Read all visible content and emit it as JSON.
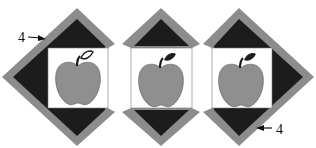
{
  "diagram": {
    "colors": {
      "background": "#ffffff",
      "border_strip": "#8c8c8c",
      "dark_triangle": "#1c1c1c",
      "center_square": "#ffffff",
      "apple": "#8f8f8f",
      "stem": "#1c1c1c",
      "outline": "#333333"
    },
    "blocks": [
      {
        "id": "left",
        "variant": "left-pointing",
        "leaf_style": "outlined"
      },
      {
        "id": "center",
        "variant": "top-bottom-pointing",
        "leaf_style": "filled"
      },
      {
        "id": "right",
        "variant": "right-pointing",
        "leaf_style": "filled"
      }
    ],
    "labels": [
      {
        "text": "4",
        "position": "upper-left",
        "arrow": "right"
      },
      {
        "text": "4",
        "position": "lower-right",
        "arrow": "left"
      }
    ]
  }
}
